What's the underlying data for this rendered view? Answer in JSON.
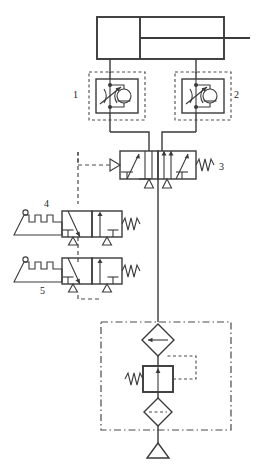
{
  "diagram": {
    "type": "pneumatic-circuit-schematic",
    "line_color": "#3a3a3a",
    "dash_color": "#4a4a4a",
    "background": "#ffffff"
  },
  "labels": {
    "flow_control_1": "1",
    "flow_control_2": "2",
    "directional_valve_3": "3",
    "limit_valve_4": "4",
    "limit_valve_5": "5"
  },
  "components": {
    "cylinder": {
      "name": "double-acting-cylinder",
      "description": "Double acting cylinder with piston and rod extending right"
    },
    "flow_control_1": {
      "name": "flow-control-valve-1",
      "label": "1",
      "description": "One-way flow control valve: adjustable throttle parallel with check valve, enclosed in dashed unit envelope"
    },
    "flow_control_2": {
      "name": "flow-control-valve-2",
      "label": "2",
      "description": "One-way flow control valve: adjustable throttle parallel with check valve, enclosed in dashed unit envelope"
    },
    "directional_valve_3": {
      "name": "directional-control-valve-3",
      "label": "3",
      "description": "5/2 directional control valve, pilot operated with spring return"
    },
    "limit_valve_4": {
      "name": "roller-lever-valve-4",
      "label": "4",
      "description": "3/2 roller lever operated valve with spring return"
    },
    "limit_valve_5": {
      "name": "roller-lever-valve-5",
      "label": "5",
      "description": "3/2 roller lever operated valve with spring return"
    },
    "service_unit": {
      "name": "air-service-unit",
      "description": "Air preparation group enclosed in dash-dot envelope",
      "parts": {
        "lubricator": "Lubricator (diamond with horizontal line)",
        "regulator": "Pressure regulator with adjusting spring and pilot line",
        "filter": "Filter with water separator (diamond with dashed line)",
        "source": "Compressed air source (triangle)"
      }
    }
  }
}
